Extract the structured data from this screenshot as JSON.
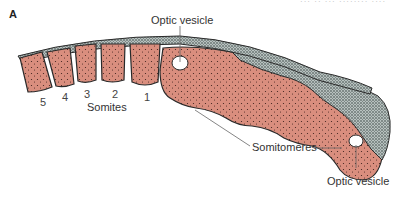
{
  "figure": {
    "panel_label": "A",
    "caption_fragment": "··· ·· ··· ········ ····",
    "colors": {
      "mesoderm": "#d98e7e",
      "neural": "#9aa6a4",
      "outline": "#2a2a2a",
      "leader": "#666666"
    },
    "labels": {
      "optic_vesicle_top": "Optic vesicle",
      "somites": "Somites",
      "somitomeres": "Somitomeres",
      "optic_vesicle_bottom": "Optic vesicle"
    },
    "somite_numbers": [
      "5",
      "4",
      "3",
      "2",
      "1"
    ]
  }
}
